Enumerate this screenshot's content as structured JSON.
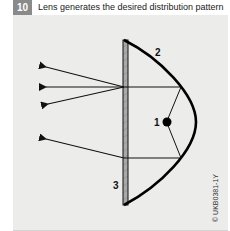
{
  "header": {
    "step_number": "10",
    "title": "Lens generates the desired distribution pattern",
    "badge_color": "#8a8a8a"
  },
  "diagram": {
    "background_color": "#ececeb",
    "labels": {
      "bulb": "1",
      "reflector": "2",
      "lens": "3"
    },
    "components": [
      {
        "id": "1",
        "name": "bulb"
      },
      {
        "id": "2",
        "name": "reflector"
      },
      {
        "id": "3",
        "name": "lens"
      }
    ],
    "credit": "© UKB0381-1Y"
  }
}
